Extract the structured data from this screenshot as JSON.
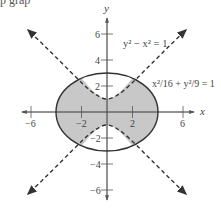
{
  "top_fragment": "p grap",
  "axes": {
    "x_label": "x",
    "y_label": "y",
    "x_ticks": [
      {
        "value": -6,
        "label": "−6"
      },
      {
        "value": -2,
        "label": "−2"
      },
      {
        "value": 2,
        "label": "2"
      },
      {
        "value": 6,
        "label": "6"
      }
    ],
    "y_ticks": [
      {
        "value": 6,
        "label": "6"
      },
      {
        "value": 4,
        "label": "4"
      },
      {
        "value": 2,
        "label": "2"
      },
      {
        "value": -2,
        "label": "−2"
      },
      {
        "value": -4,
        "label": "−4"
      },
      {
        "value": -6,
        "label": "−6"
      }
    ]
  },
  "curves": {
    "hyperbola_label": "y² − x² = 1",
    "ellipse_label": "x²/16 + y²/9 = 1"
  },
  "colors": {
    "shade": "#c8c8c8",
    "ellipse_stroke": "#333333",
    "hyperbola_stroke": "#333333",
    "axis": "#555555"
  }
}
